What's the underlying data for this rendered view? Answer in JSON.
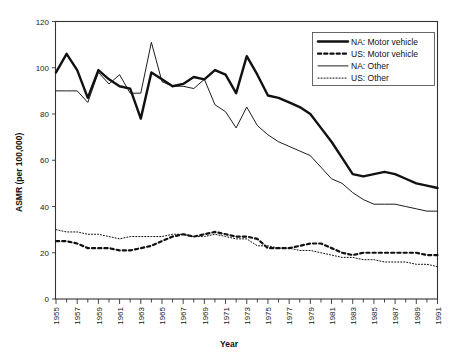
{
  "chart_data": {
    "type": "line",
    "title": "",
    "xlabel": "Year",
    "ylabel": "ASMR (per 100,000)",
    "xlim": [
      1955,
      1991
    ],
    "ylim": [
      0,
      120
    ],
    "yticks": [
      0,
      20,
      40,
      60,
      80,
      100,
      120
    ],
    "xticks": [
      1955,
      1957,
      1959,
      1961,
      1963,
      1965,
      1967,
      1969,
      1971,
      1973,
      1975,
      1977,
      1979,
      1981,
      1983,
      1985,
      1987,
      1989,
      1991
    ],
    "xtick_labels": [
      "1955",
      "1957",
      "1959",
      "1961",
      "1963",
      "1965",
      "1967",
      "1969",
      "1971",
      "1973",
      "1975",
      "1977",
      "1979",
      "1981",
      "1983",
      "1985",
      "1987",
      "1989",
      "1991"
    ],
    "ytick_labels": [
      "0",
      "20",
      "40",
      "60",
      "80",
      "100",
      "120"
    ],
    "minor_xticks_every": 1,
    "grid": false,
    "legend_position": "top-right",
    "x": [
      1955,
      1956,
      1957,
      1958,
      1959,
      1960,
      1961,
      1962,
      1963,
      1964,
      1965,
      1966,
      1967,
      1968,
      1969,
      1970,
      1971,
      1972,
      1973,
      1974,
      1975,
      1976,
      1977,
      1978,
      1979,
      1980,
      1981,
      1982,
      1983,
      1984,
      1985,
      1986,
      1987,
      1988,
      1989,
      1990,
      1991
    ],
    "series": [
      {
        "name": "NA: Motor vehicle",
        "style": "thick-solid",
        "values": [
          98,
          106,
          99,
          87,
          99,
          95,
          92,
          91,
          78,
          98,
          95,
          92,
          93,
          96,
          95,
          99,
          97,
          89,
          105,
          97,
          88,
          87,
          85,
          83,
          80,
          74,
          68,
          61,
          54,
          53,
          54,
          55,
          54,
          52,
          50,
          49,
          48
        ]
      },
      {
        "name": "US: Motor vehicle",
        "style": "thick-dashed",
        "values": [
          25,
          25,
          24,
          22,
          22,
          22,
          21,
          21,
          22,
          23,
          25,
          27,
          28,
          27,
          28,
          29,
          28,
          27,
          27,
          26,
          22,
          22,
          22,
          23,
          24,
          24,
          22,
          20,
          19,
          20,
          20,
          20,
          20,
          20,
          20,
          19,
          19
        ]
      },
      {
        "name": "NA: Other",
        "style": "thin-solid",
        "values": [
          90,
          90,
          90,
          85,
          98,
          93,
          97,
          89,
          89,
          111,
          94,
          92,
          92,
          91,
          95,
          84,
          81,
          74,
          83,
          75,
          71,
          68,
          66,
          64,
          62,
          57,
          52,
          50,
          46,
          43,
          41,
          41,
          41,
          40,
          39,
          38,
          38
        ]
      },
      {
        "name": "US: Other",
        "style": "thin-dotted",
        "values": [
          30,
          29,
          29,
          28,
          28,
          27,
          26,
          27,
          27,
          27,
          27,
          28,
          28,
          27,
          27,
          28,
          27,
          26,
          26,
          23,
          23,
          22,
          22,
          21,
          21,
          20,
          19,
          18,
          18,
          17,
          17,
          16,
          16,
          16,
          15,
          15,
          14
        ]
      }
    ],
    "legend": [
      {
        "label": "NA: Motor vehicle",
        "style": "thick-solid"
      },
      {
        "label": "US: Motor vehicle",
        "style": "thick-dashed"
      },
      {
        "label": "NA: Other",
        "style": "thin-solid"
      },
      {
        "label": "US: Other",
        "style": "thin-dotted"
      }
    ]
  }
}
